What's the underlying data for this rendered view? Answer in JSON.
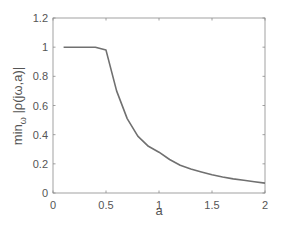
{
  "chart_data": {
    "type": "line",
    "title": "",
    "xlabel": "a",
    "ylabel": "min_ω |ρ(jω,a)|",
    "ylabel_main": "min",
    "ylabel_sub": "ω",
    "ylabel_rest": " |ρ(jω,a)|",
    "xlim": [
      0,
      2
    ],
    "ylim": [
      0,
      1.2
    ],
    "xticks": [
      0,
      0.5,
      1,
      1.5,
      2
    ],
    "xtick_labels": [
      "0",
      "0.5",
      "1",
      "1.5",
      "2"
    ],
    "yticks": [
      0,
      0.2,
      0.4,
      0.6,
      0.8,
      1,
      1.2
    ],
    "ytick_labels": [
      "0",
      "0.2",
      "0.4",
      "0.6",
      "0.8",
      "1",
      "1.2"
    ],
    "grid": false,
    "legend": null,
    "series": [
      {
        "name": "min_ω |ρ(jω,a)|",
        "color": "#707070",
        "x": [
          0.1,
          0.2,
          0.3,
          0.4,
          0.5,
          0.6,
          0.7,
          0.8,
          0.9,
          1.0,
          1.1,
          1.2,
          1.3,
          1.4,
          1.5,
          1.6,
          1.7,
          1.8,
          1.9,
          2.0
        ],
        "y": [
          1.0,
          1.0,
          1.0,
          1.0,
          0.98,
          0.7,
          0.51,
          0.39,
          0.32,
          0.28,
          0.23,
          0.19,
          0.165,
          0.145,
          0.125,
          0.11,
          0.097,
          0.087,
          0.077,
          0.068
        ]
      }
    ]
  },
  "colors": {
    "axis": "#8a8a8a",
    "text": "#555555",
    "line": "#707070"
  }
}
